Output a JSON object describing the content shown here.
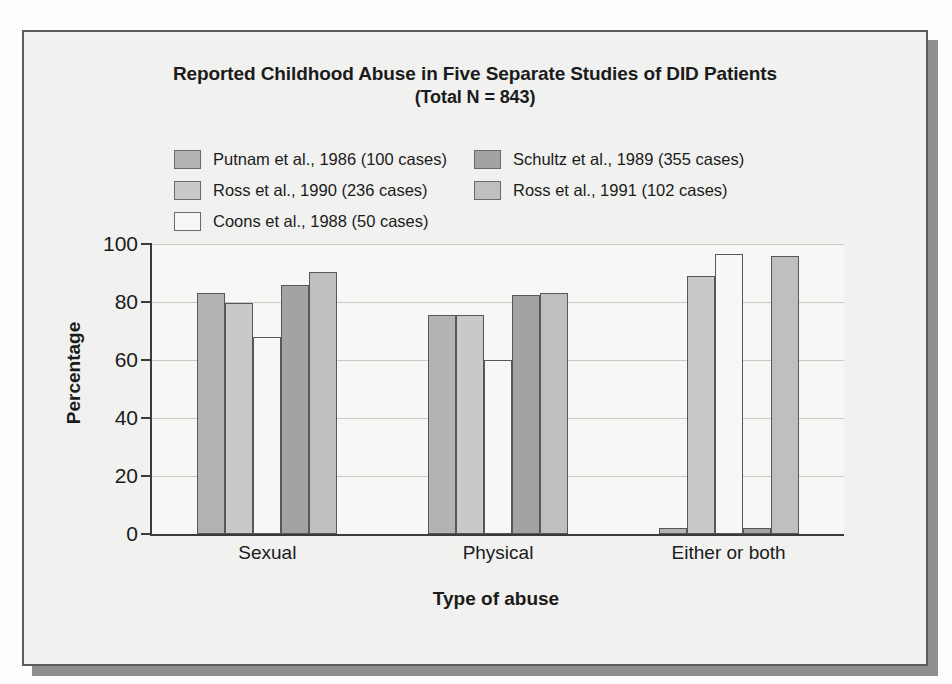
{
  "figure": {
    "title_line1": "Reported Childhood Abuse in Five Separate Studies of DID Patients",
    "title_line2": "(Total N = 843)"
  },
  "chart_data": {
    "type": "bar",
    "title": "Reported Childhood Abuse in Five Separate Studies of DID Patients (Total N = 843)",
    "xlabel": "Type of abuse",
    "ylabel": "Percentage",
    "ylim": [
      0,
      100
    ],
    "yticks": [
      0,
      20,
      40,
      60,
      80,
      100
    ],
    "ytick_labels": [
      "0",
      "20",
      "40",
      "60",
      "80",
      "100"
    ],
    "grid": true,
    "legend_position": "above-plot",
    "categories": [
      "Sexual",
      "Physical",
      "Either or both"
    ],
    "series": [
      {
        "name": "Putnam et al., 1986 (100 cases)",
        "color": "#b3b3b3",
        "values": [
          83,
          75.5,
          2
        ]
      },
      {
        "name": "Ross et al., 1990 (236 cases)",
        "color": "#c9c9c9",
        "values": [
          79.5,
          75.5,
          89
        ]
      },
      {
        "name": "Coons et al., 1988 (50 cases)",
        "color": "#f7f7f5",
        "values": [
          68,
          60,
          96.5
        ]
      },
      {
        "name": "Schultz et al., 1989 (355 cases)",
        "color": "#a3a3a3",
        "values": [
          86,
          82.5,
          2
        ]
      },
      {
        "name": "Ross et al., 1991 (102 cases)",
        "color": "#bfbfbf",
        "values": [
          90.5,
          83,
          96
        ]
      }
    ]
  }
}
